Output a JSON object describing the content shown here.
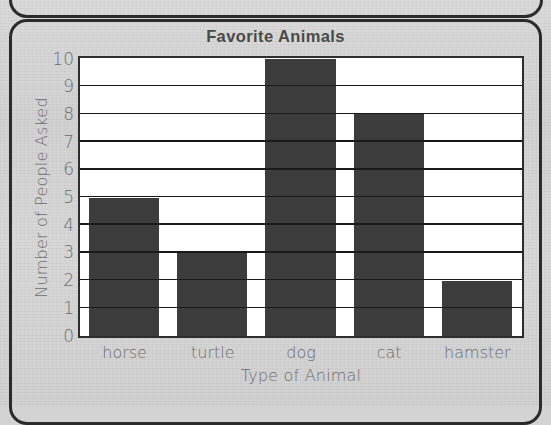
{
  "page": {
    "background_color": "#d3d3d3",
    "panel_border_color": "#2b2b2b"
  },
  "chart_data": {
    "type": "bar",
    "title": "Favorite Animals",
    "xlabel": "Type of Animal",
    "ylabel": "Number of People Asked",
    "categories": [
      "horse",
      "turtle",
      "dog",
      "cat",
      "hamster"
    ],
    "values": [
      5,
      3,
      10,
      8,
      2
    ],
    "ylim": [
      0,
      10
    ],
    "ytick_labels": [
      "0",
      "1",
      "2",
      "3",
      "4",
      "5",
      "6",
      "7",
      "8",
      "9",
      "10"
    ],
    "ytick_values": [
      0,
      1,
      2,
      3,
      4,
      5,
      6,
      7,
      8,
      9,
      10
    ],
    "grid": true,
    "grid_axis": "y",
    "legend": false,
    "bar_color": "#3c3c3c",
    "plot_background": "#ffffff",
    "axis_color": "#2e2e2e",
    "label_color": "#6d6d6d",
    "title_color": "#4a4a4a"
  }
}
